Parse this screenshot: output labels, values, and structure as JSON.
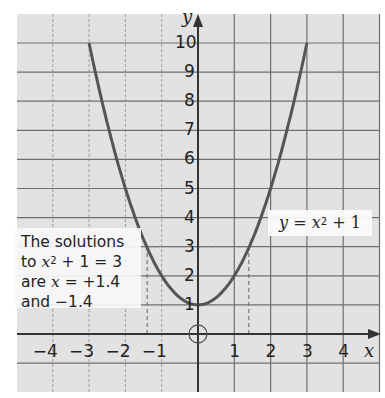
{
  "chart_data": {
    "type": "line",
    "title": "",
    "xlabel": "x",
    "ylabel": "y",
    "function": "y = x^2 + 1",
    "x": [
      -3,
      -2.5,
      -2,
      -1.5,
      -1,
      -0.5,
      0,
      0.5,
      1,
      1.5,
      2,
      2.5,
      3
    ],
    "series": [
      {
        "name": "y = x² + 1",
        "values": [
          10,
          7.25,
          5,
          3.25,
          2,
          1.25,
          1,
          1.25,
          2,
          3.25,
          5,
          7.25,
          10
        ]
      }
    ],
    "xlim": [
      -5,
      5
    ],
    "ylim": [
      -2,
      11
    ],
    "x_ticks": [
      "-4",
      "-3",
      "-2",
      "-1",
      "1",
      "2",
      "3",
      "4"
    ],
    "y_ticks": [
      "1",
      "2",
      "3",
      "4",
      "5",
      "6",
      "7",
      "8",
      "9",
      "10"
    ],
    "grid": true,
    "annotations": [
      {
        "type": "hline-dashed",
        "y": 3,
        "from_x": -1.4,
        "to_x": 1.4
      },
      {
        "type": "vline-dashed",
        "x": -1.4,
        "from_y": 0,
        "to_y": 3
      },
      {
        "type": "vline-dashed",
        "x": 1.4,
        "from_y": 0,
        "to_y": 3
      },
      {
        "type": "circle",
        "x": 0,
        "y": 0,
        "label": "origin"
      }
    ],
    "solutions": [
      1.4,
      -1.4
    ]
  },
  "labels": {
    "x_axis": "x",
    "y_axis": "y",
    "equation_prefix": "y = x",
    "equation_suffix": " + 1",
    "exponent": "2",
    "note_line1": "The solutions",
    "note_line2_pre": "to ",
    "note_line2_var": "x",
    "note_line2_post": " + 1 = 3",
    "note_line3_pre": "are ",
    "note_line3_var": "x",
    "note_line3_post": " = +1.4",
    "note_line4": "and −1.4"
  },
  "ticks": {
    "x": [
      {
        "v": -4,
        "t": "−4"
      },
      {
        "v": -3,
        "t": "−3"
      },
      {
        "v": -2,
        "t": "−2"
      },
      {
        "v": -1,
        "t": "−1"
      },
      {
        "v": 1,
        "t": "1"
      },
      {
        "v": 2,
        "t": "2"
      },
      {
        "v": 3,
        "t": "3"
      },
      {
        "v": 4,
        "t": "4"
      }
    ],
    "y": [
      "1",
      "2",
      "3",
      "4",
      "5",
      "6",
      "7",
      "8",
      "9",
      "10"
    ]
  },
  "colors": {
    "background": "#e2e2e2",
    "grid": "#6f6f6f",
    "axis": "#333333",
    "curve": "#555555",
    "dashed": "#777777"
  }
}
